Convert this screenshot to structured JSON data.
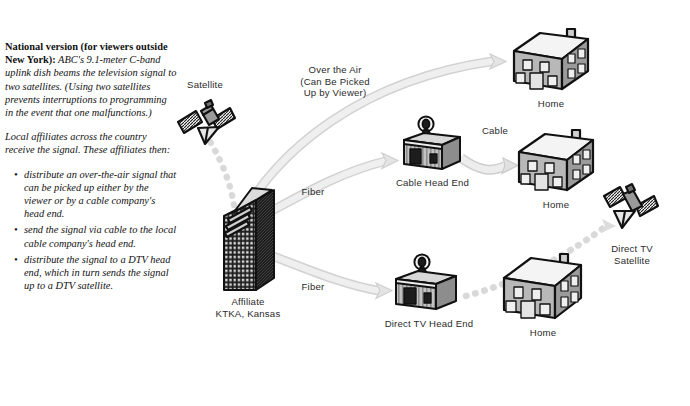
{
  "document": {
    "title": "Television Signal Distribution Diagram",
    "background_color": "#ffffff"
  },
  "sidebar_text": {
    "paragraph1_lead": "National version (for viewers outside New York):",
    "paragraph1_body": " ABC's 9.1-meter C-band uplink dish beams the television signal to two satellites. (Using two satellites prevents interruptions to programming in the event that one malfunctions.)",
    "paragraph2": "Local affiliates across the country receive the signal. These affiliates then:",
    "bullets": [
      "distribute an over-the-air signal that can be picked up either by the viewer or by a cable company's head end.",
      "send the signal via cable to the local cable company's head end.",
      "distribute the signal to a DTV head end, which in turn sends the signal up to a DTV satellite."
    ]
  },
  "nodes": [
    {
      "id": "satellite",
      "label": "Satellite"
    },
    {
      "id": "affiliate",
      "label": "Affiliate\nKTKA, Kansas"
    },
    {
      "id": "cable-head-end",
      "label": "Cable Head End"
    },
    {
      "id": "dtv-head-end",
      "label": "Direct TV Head End"
    },
    {
      "id": "home-top",
      "label": "Home"
    },
    {
      "id": "home-middle",
      "label": "Home"
    },
    {
      "id": "home-bottom",
      "label": "Home"
    },
    {
      "id": "dtv-satellite",
      "label": "Direct TV\nSatellite"
    }
  ],
  "flow_labels": {
    "over_the_air": "Over the Air\n(Can Be Picked\nUp by Viewer)",
    "fiber_upper": "Fiber",
    "fiber_lower": "Fiber",
    "cable": "Cable"
  },
  "colors": {
    "flow_arrow_fill": "#ececec",
    "flow_arrow_stroke": "#d2d2d2",
    "dotted_beam": "#d8d8d8",
    "building_dark": "#1d1d1d",
    "building_gray": "#b5b5b5",
    "house_wall": "#b8b8b8",
    "roof_light": "#f2f2f2",
    "outline": "#111111",
    "text": "#2b2b2b"
  }
}
